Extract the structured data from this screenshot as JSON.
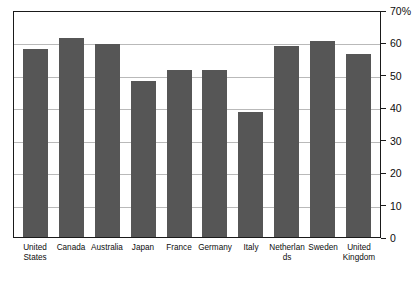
{
  "chart_data": {
    "type": "bar",
    "title": "",
    "subtitle": "",
    "xlabel": "",
    "ylabel": "",
    "categories": [
      "United States",
      "Canada",
      "Australia",
      "Japan",
      "France",
      "Germany",
      "Italy",
      "Netherlands",
      "Sweden",
      "United Kingdom"
    ],
    "values": [
      58,
      61.5,
      59.5,
      48,
      51.5,
      51.5,
      38.5,
      59,
      60.5,
      56.5
    ],
    "ylim": [
      0,
      70
    ],
    "yticks": [
      0,
      10,
      20,
      30,
      40,
      50,
      60,
      70
    ],
    "ytick_labels": [
      "0",
      "10",
      "20",
      "30",
      "40",
      "50",
      "60",
      "70%"
    ],
    "grid": true,
    "legend": "none",
    "bar_color": "#565656",
    "grid_color": "#b9b9b9",
    "axis_color": "#1a1a1a"
  }
}
